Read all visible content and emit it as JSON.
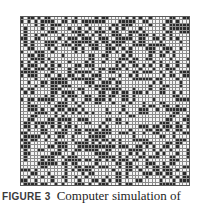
{
  "figure": {
    "label": "FIGURE 3",
    "caption_text": "Computer simulation of",
    "grid": {
      "rows": 50,
      "cols": 50,
      "occupied_fraction": 0.42,
      "seed": 1987,
      "colors": {
        "empty": "#f3f3f3",
        "occupied": "#2b2b2b",
        "gridline": "#8c8c8c"
      }
    }
  }
}
